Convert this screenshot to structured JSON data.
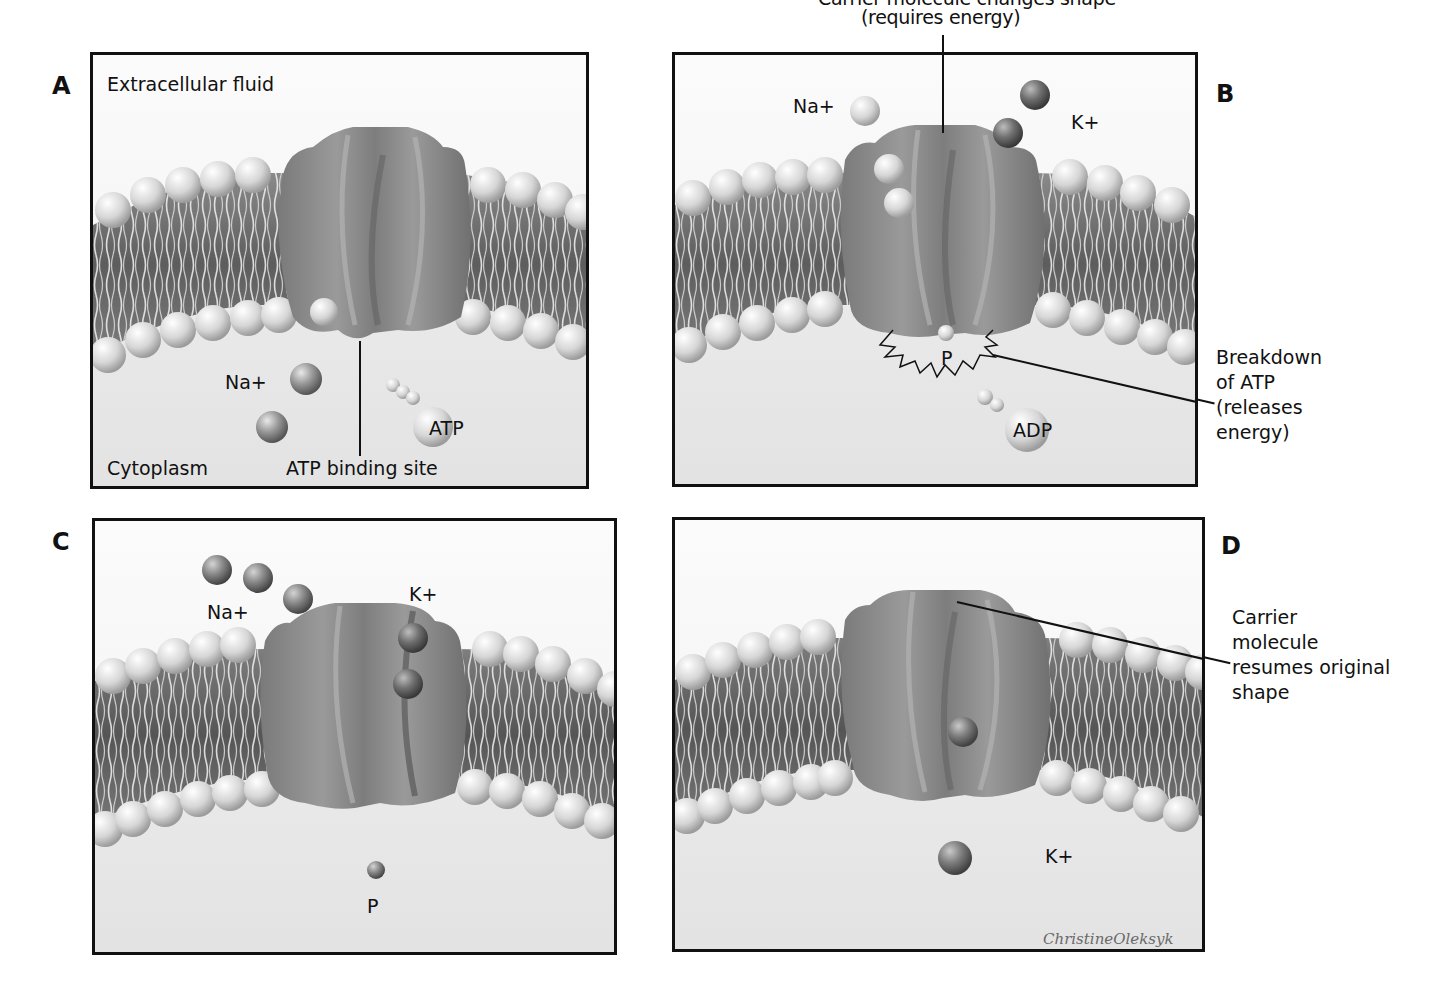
{
  "figure": {
    "top_caption_partial": "Carrier molecule changes shape",
    "top_caption_line2": "(requires energy)"
  },
  "panels": {
    "A": {
      "letter": "A",
      "extracellular_label": "Extracellular fluid",
      "cytoplasm_label": "Cytoplasm",
      "binding_site_label": "ATP binding site",
      "ion_label": "Na+",
      "atp_label": "ATP"
    },
    "B": {
      "letter": "B",
      "na_label": "Na+",
      "k_label": "K+",
      "p_label": "P",
      "adp_label": "ADP",
      "side_callout": [
        "Breakdown",
        "of ATP",
        "(releases",
        "energy)"
      ]
    },
    "C": {
      "letter": "C",
      "na_label": "Na+",
      "k_label": "K+",
      "p_label": "P"
    },
    "D": {
      "letter": "D",
      "k_label": "K+",
      "side_callout": [
        "Carrier",
        "molecule",
        "resumes original",
        "shape"
      ],
      "signature": "ChristineOleksyk"
    }
  },
  "colors": {
    "frame": "#111111",
    "membrane_core": "#6e6e6e",
    "protein": "#8c8c8c",
    "head": "#d8d8d8",
    "background_top": "#f8f8f8",
    "background_bottom": "#e4e4e4"
  }
}
